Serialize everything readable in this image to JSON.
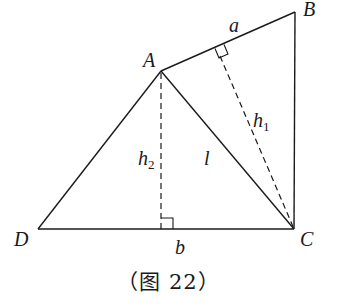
{
  "figure": {
    "caption": "（图 22）",
    "points": {
      "A": {
        "label": "A",
        "x": 161,
        "y": 71
      },
      "B": {
        "label": "B",
        "x": 295,
        "y": 12
      },
      "C": {
        "label": "C",
        "x": 294,
        "y": 229
      },
      "D": {
        "label": "D",
        "x": 38,
        "y": 229
      }
    },
    "segments": [
      {
        "name": "AB",
        "from": "A",
        "to": "B",
        "style": "solid",
        "label": "a"
      },
      {
        "name": "BC",
        "from": "B",
        "to": "C",
        "style": "solid"
      },
      {
        "name": "DC",
        "from": "D",
        "to": "C",
        "style": "solid",
        "label": "b"
      },
      {
        "name": "AD",
        "from": "A",
        "to": "D",
        "style": "solid"
      },
      {
        "name": "AC",
        "from": "A",
        "to": "C",
        "style": "solid",
        "label": "l"
      },
      {
        "name": "h1",
        "from": "C",
        "to": "foot on AB",
        "style": "dashed",
        "label": "h1"
      },
      {
        "name": "h2",
        "from": "A",
        "to": "foot on DC",
        "style": "dashed",
        "label": "h2"
      }
    ],
    "labels": {
      "A": "A",
      "B": "B",
      "C": "C",
      "D": "D",
      "a": "a",
      "b": "b",
      "l": "l",
      "h1_main": "h",
      "h1_sub": "1",
      "h2_main": "h",
      "h2_sub": "2"
    },
    "right_angles": [
      "foot of h1 on AB",
      "foot of h2 on DC"
    ]
  }
}
